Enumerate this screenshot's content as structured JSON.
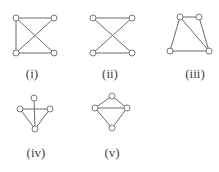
{
  "figure": {
    "graphs": [
      {
        "id": "i",
        "label": "(i)",
        "label_pos": [
          32,
          78
        ],
        "nodes": [
          [
            16,
            18
          ],
          [
            54,
            18
          ],
          [
            16,
            53
          ],
          [
            54,
            53
          ]
        ],
        "edges": [
          [
            0,
            1
          ],
          [
            0,
            2
          ],
          [
            2,
            3
          ],
          [
            0,
            3
          ],
          [
            1,
            2
          ]
        ]
      },
      {
        "id": "ii",
        "label": "(ii)",
        "label_pos": [
          110,
          78
        ],
        "nodes": [
          [
            93,
            18
          ],
          [
            132,
            18
          ],
          [
            93,
            53
          ],
          [
            132,
            53
          ]
        ],
        "edges": [
          [
            0,
            1
          ],
          [
            2,
            3
          ],
          [
            0,
            3
          ],
          [
            1,
            2
          ]
        ]
      },
      {
        "id": "iii",
        "label": "(iii)",
        "label_pos": [
          195,
          78
        ],
        "nodes": [
          [
            180,
            17
          ],
          [
            199,
            17
          ],
          [
            170,
            51
          ],
          [
            209,
            51
          ]
        ],
        "edges": [
          [
            0,
            1
          ],
          [
            0,
            2
          ],
          [
            1,
            3
          ],
          [
            2,
            3
          ],
          [
            0,
            3
          ]
        ]
      },
      {
        "id": "iv",
        "label": "(iv)",
        "label_pos": [
          36,
          157
        ],
        "nodes": [
          [
            34,
            98
          ],
          [
            20,
            109
          ],
          [
            50,
            109
          ],
          [
            35,
            129
          ]
        ],
        "edges": [
          [
            0,
            3
          ],
          [
            1,
            2
          ],
          [
            1,
            3
          ],
          [
            2,
            3
          ]
        ]
      },
      {
        "id": "v",
        "label": "(v)",
        "label_pos": [
          112,
          157
        ],
        "nodes": [
          [
            112,
            96
          ],
          [
            95,
            108
          ],
          [
            127,
            108
          ],
          [
            112,
            128
          ]
        ],
        "edges": [
          [
            0,
            1
          ],
          [
            0,
            2
          ],
          [
            1,
            2
          ],
          [
            1,
            3
          ],
          [
            2,
            3
          ]
        ]
      }
    ]
  }
}
